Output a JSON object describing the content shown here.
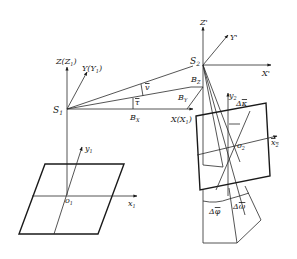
{
  "diagram": {
    "title": "",
    "left_system": {
      "projection_center": "S1",
      "axis_z": "Z(Z1)",
      "axis_y": "Y(Y1)",
      "axis_x": "X(X1)",
      "image_origin": "o1",
      "image_x": "x1",
      "image_y": "y1"
    },
    "baseline": {
      "bx": "BX",
      "by": "BY",
      "bz": "BZ",
      "angle_v": "v̄",
      "angle_tau": "τ̄"
    },
    "right_system": {
      "projection_center": "S2",
      "axis_z": "Z'",
      "axis_y": "Y'",
      "axis_x": "X'",
      "image_origin": "o2",
      "image_x": "x2",
      "image_y": "y2",
      "rot_kappa": "Δκ̄",
      "rot_phi": "Δφ̄",
      "rot_omega": "Δω̄"
    }
  }
}
